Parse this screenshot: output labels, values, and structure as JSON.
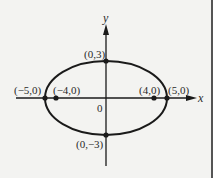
{
  "figure": {
    "type": "ellipse-diagram",
    "equation_implied": "x^2/25 + y^2/9 = 1",
    "axes": {
      "x_label": "x",
      "y_label": "y",
      "origin_label": "0"
    },
    "ellipse": {
      "center": [
        0,
        0
      ],
      "a": 5,
      "b": 3
    },
    "points": [
      {
        "name": "left-vertex",
        "coords": [
          -5,
          0
        ],
        "label": "(−5,0)"
      },
      {
        "name": "left-focus",
        "coords": [
          -4,
          0
        ],
        "label": "(−4,0)"
      },
      {
        "name": "right-focus",
        "coords": [
          4,
          0
        ],
        "label": "(4,0)"
      },
      {
        "name": "right-vertex",
        "coords": [
          5,
          0
        ],
        "label": "(5,0)"
      },
      {
        "name": "top-covertex",
        "coords": [
          0,
          3
        ],
        "label": "(0,3)"
      },
      {
        "name": "bottom-covertex",
        "coords": [
          0,
          -3
        ],
        "label": "(0,−3)"
      }
    ],
    "colors": {
      "ink": "#1a1a1a",
      "background": "#f3f3f1"
    }
  }
}
